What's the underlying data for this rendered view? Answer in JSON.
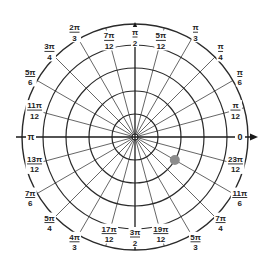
{
  "diagram": {
    "type": "polar-grid",
    "center": [
      135,
      137
    ],
    "ring_radii": [
      23,
      46,
      69,
      92,
      113
    ],
    "colors": {
      "background": "#ffffff",
      "ring": "#2a2a2a",
      "spoke": "#555555",
      "axis": "#1a1a1a",
      "point": "#8c8c8c",
      "label": "#222222"
    },
    "axes": {
      "horizontal_extent": [
        16,
        258
      ],
      "vertical_top": 22,
      "right_label": "0",
      "left_label": "π"
    },
    "angle_labels": [
      {
        "num": "π",
        "den": "12",
        "deg": 15,
        "r": 104
      },
      {
        "num": "π",
        "den": "6",
        "deg": 30,
        "r": 121
      },
      {
        "num": "π",
        "den": "4",
        "deg": 45,
        "r": 121
      },
      {
        "num": "π",
        "den": "3",
        "deg": 60,
        "r": 121
      },
      {
        "num": "5π",
        "den": "12",
        "deg": 75,
        "r": 100
      },
      {
        "num": "π",
        "den": "2",
        "deg": 90,
        "r": 100
      },
      {
        "num": "7π",
        "den": "12",
        "deg": 105,
        "r": 100
      },
      {
        "num": "2π",
        "den": "3",
        "deg": 120,
        "r": 121
      },
      {
        "num": "3π",
        "den": "4",
        "deg": 135,
        "r": 121
      },
      {
        "num": "5π",
        "den": "6",
        "deg": 150,
        "r": 121
      },
      {
        "num": "11π",
        "den": "12",
        "deg": 165,
        "r": 104
      },
      {
        "num": "13π",
        "den": "12",
        "deg": 195,
        "r": 104
      },
      {
        "num": "7π",
        "den": "6",
        "deg": 210,
        "r": 121
      },
      {
        "num": "5π",
        "den": "4",
        "deg": 225,
        "r": 121
      },
      {
        "num": "4π",
        "den": "3",
        "deg": 240,
        "r": 121
      },
      {
        "num": "17π",
        "den": "12",
        "deg": 255,
        "r": 100
      },
      {
        "num": "3π",
        "den": "2",
        "deg": 270,
        "r": 100
      },
      {
        "num": "19π",
        "den": "12",
        "deg": 285,
        "r": 100
      },
      {
        "num": "5π",
        "den": "3",
        "deg": 300,
        "r": 121
      },
      {
        "num": "7π",
        "den": "4",
        "deg": 315,
        "r": 121
      },
      {
        "num": "11π",
        "den": "6",
        "deg": 330,
        "r": 121
      },
      {
        "num": "23π",
        "den": "12",
        "deg": 345,
        "r": 104
      }
    ],
    "plotted_point": {
      "r_ring": 2,
      "angle": "11π/6",
      "deg": 330,
      "radius_px": 5
    }
  }
}
